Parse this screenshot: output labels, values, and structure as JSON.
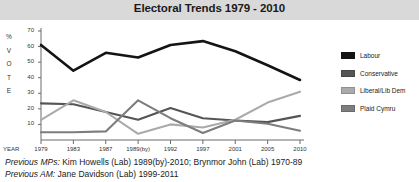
{
  "title": "Electoral Trends 1979 - 2010",
  "axis": {
    "y_title_chars": "%\nV\nO\nT\nE",
    "x_label": "YEAR"
  },
  "legend": {
    "items": [
      {
        "label": "Labour",
        "color": "#141414"
      },
      {
        "label": "Conservative",
        "color": "#555555"
      },
      {
        "label": "Liberal/Lib Dem",
        "color": "#aaaaaa"
      },
      {
        "label": "Plaid Cymru",
        "color": "#7d7d7d"
      }
    ]
  },
  "footnotes": [
    {
      "lead": "Previous MPs:",
      "text": " Kim Howells (Lab) 1989(by)-2010; Brynmor John (Lab) 1970-89"
    },
    {
      "lead": "Previous AM:",
      "text": " Jane Davidson (Lab) 1999-2011"
    }
  ],
  "chart_data": {
    "type": "line",
    "title": "Electoral Trends 1979 - 2010",
    "xlabel": "YEAR",
    "ylabel": "% VOTE",
    "categories": [
      "1979",
      "1983",
      "1987",
      "1989(by)",
      "1992",
      "1997",
      "2001",
      "2005",
      "2010"
    ],
    "yticks": [
      10,
      20,
      30,
      40,
      50,
      60,
      70
    ],
    "ylim": [
      0,
      70
    ],
    "grid": false,
    "legend_position": "right",
    "series": [
      {
        "name": "Labour",
        "color": "#141414",
        "values": [
          61,
          44.5,
          56,
          53,
          61,
          63.5,
          57,
          48,
          38.5
        ]
      },
      {
        "name": "Conservative",
        "color": "#555555",
        "values": [
          23.5,
          23,
          18,
          13,
          20.5,
          14,
          12.5,
          11.5,
          15.5
        ]
      },
      {
        "name": "Liberal/Lib Dem",
        "color": "#aaaaaa",
        "values": [
          13,
          25.5,
          18,
          4,
          10,
          8,
          13,
          24,
          31
        ]
      },
      {
        "name": "Plaid Cymru",
        "color": "#7d7d7d",
        "values": [
          5,
          5,
          5.5,
          25.5,
          14,
          4.5,
          12.5,
          10.5,
          6
        ]
      }
    ]
  }
}
